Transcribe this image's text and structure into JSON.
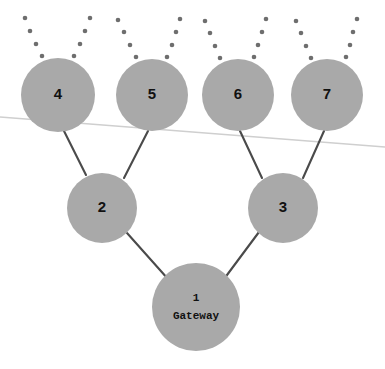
{
  "diagram": {
    "canvas": {
      "width": 385,
      "height": 369,
      "background": "#ffffff"
    },
    "colors": {
      "node_fill": "#a9a9a9",
      "edge_stroke": "#4a4a4a",
      "label_text": "#111111",
      "horizon_stroke": "#cfcfcf",
      "uplink_dot": "#6e6e6e"
    },
    "nodes": [
      {
        "id": "1",
        "label": "1",
        "sublabel": "Gateway",
        "cx": 196,
        "cy": 307,
        "r": 44,
        "label_size": 11,
        "mono": true,
        "has_uplinks": false
      },
      {
        "id": "2",
        "label": "2",
        "sublabel": "",
        "cx": 102,
        "cy": 208,
        "r": 35,
        "label_size": 15,
        "mono": false,
        "has_uplinks": false
      },
      {
        "id": "3",
        "label": "3",
        "sublabel": "",
        "cx": 283,
        "cy": 208,
        "r": 35,
        "label_size": 15,
        "mono": false,
        "has_uplinks": false
      },
      {
        "id": "4",
        "label": "4",
        "sublabel": "",
        "cx": 58,
        "cy": 95,
        "r": 37,
        "label_size": 15,
        "mono": false,
        "has_uplinks": true
      },
      {
        "id": "5",
        "label": "5",
        "sublabel": "",
        "cx": 152,
        "cy": 95,
        "r": 36,
        "label_size": 15,
        "mono": false,
        "has_uplinks": true
      },
      {
        "id": "6",
        "label": "6",
        "sublabel": "",
        "cx": 238,
        "cy": 95,
        "r": 36,
        "label_size": 15,
        "mono": false,
        "has_uplinks": true
      },
      {
        "id": "7",
        "label": "7",
        "sublabel": "",
        "cx": 327,
        "cy": 95,
        "r": 36,
        "label_size": 15,
        "mono": false,
        "has_uplinks": true
      }
    ],
    "edges": [
      {
        "from": "2",
        "to": "1",
        "x1": 127,
        "y1": 233,
        "x2": 168,
        "y2": 279
      },
      {
        "from": "3",
        "to": "1",
        "x1": 259,
        "y1": 232,
        "x2": 224,
        "y2": 279
      },
      {
        "from": "4",
        "to": "2",
        "x1": 64,
        "y1": 131,
        "x2": 86,
        "y2": 175
      },
      {
        "from": "5",
        "to": "2",
        "x1": 148,
        "y1": 131,
        "x2": 124,
        "y2": 178
      },
      {
        "from": "6",
        "to": "3",
        "x1": 240,
        "y1": 131,
        "x2": 262,
        "y2": 178
      },
      {
        "from": "7",
        "to": "3",
        "x1": 324,
        "y1": 131,
        "x2": 303,
        "y2": 178
      }
    ],
    "horizon": {
      "x1": 0,
      "y1": 117,
      "x2": 385,
      "y2": 147
    },
    "uplinks": {
      "dots_per_branch": 4,
      "dot_radius": 2.3,
      "branches": [
        {
          "node": "4",
          "side": "left",
          "dots": [
            [
              25,
              18
            ],
            [
              30,
              31
            ],
            [
              36,
              44
            ],
            [
              42,
              56
            ]
          ]
        },
        {
          "node": "4",
          "side": "right",
          "dots": [
            [
              90,
              18
            ],
            [
              85,
              31
            ],
            [
              80,
              44
            ],
            [
              74,
              56
            ]
          ]
        },
        {
          "node": "5",
          "side": "left",
          "dots": [
            [
              118,
              20
            ],
            [
              124,
              32
            ],
            [
              130,
              45
            ],
            [
              136,
              57
            ]
          ]
        },
        {
          "node": "5",
          "side": "right",
          "dots": [
            [
              180,
              19
            ],
            [
              176,
              32
            ],
            [
              172,
              45
            ],
            [
              167,
              57
            ]
          ]
        },
        {
          "node": "6",
          "side": "left",
          "dots": [
            [
              205,
              21
            ],
            [
              210,
              33
            ],
            [
              215,
              46
            ],
            [
              220,
              58
            ]
          ]
        },
        {
          "node": "6",
          "side": "right",
          "dots": [
            [
              266,
              19
            ],
            [
              262,
              32
            ],
            [
              258,
              45
            ],
            [
              254,
              57
            ]
          ]
        },
        {
          "node": "7",
          "side": "left",
          "dots": [
            [
              296,
              21
            ],
            [
              301,
              33
            ],
            [
              306,
              46
            ],
            [
              311,
              58
            ]
          ]
        },
        {
          "node": "7",
          "side": "right",
          "dots": [
            [
              357,
              19
            ],
            [
              353,
              32
            ],
            [
              350,
              45
            ],
            [
              346,
              57
            ]
          ]
        }
      ]
    }
  }
}
